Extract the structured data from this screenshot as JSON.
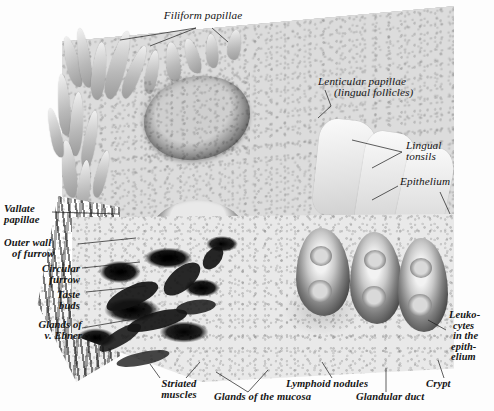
{
  "figure": {
    "kind": "anatomical-illustration",
    "style": "grayscale halftone plate",
    "background_color": "#fdfdfd",
    "ink_color": "#141414"
  },
  "labels": {
    "filiform_papillae": "Filiform papillae",
    "lenticular_papillae_l1": "Lenticular papillae",
    "lenticular_papillae_l2": "(lingual follicles)",
    "lingual_tonsils_l1": "Lingual",
    "lingual_tonsils_l2": "tonsils",
    "epithelium": "Epithelium",
    "vallate_papillae_l1": "Vallate",
    "vallate_papillae_l2": "papillae",
    "outer_wall_l1": "Outer wall",
    "outer_wall_l2": "of furrow",
    "circular_furrow_l1": "Circular",
    "circular_furrow_l2": "furrow",
    "taste_buds_l1": "Taste",
    "taste_buds_l2": "buds",
    "glands_ebner_l1": "Glands of",
    "glands_ebner_l2": "v. Ebner",
    "leukocytes_l1": "Leuko-",
    "leukocytes_l2": "cytes",
    "leukocytes_l3": "in the",
    "leukocytes_l4": "epith-",
    "leukocytes_l5": "elium",
    "striated_muscles_l1": "Striated",
    "striated_muscles_l2": "muscles",
    "glands_mucosa": "Glands of the mucosa",
    "lymphoid_nodules": "Lymphoid nodules",
    "glandular_duct": "Glandular duct",
    "crypt": "Crypt"
  }
}
